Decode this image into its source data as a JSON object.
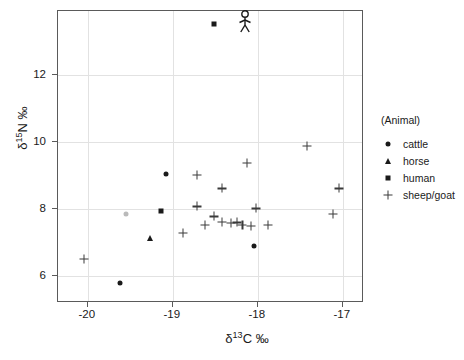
{
  "chart_data": {
    "type": "scatter",
    "title": "",
    "xlabel": "δ 13C ‰",
    "ylabel": "δ 15N ‰",
    "xlim": [
      -20.35,
      -16.75
    ],
    "ylim": [
      5.2,
      13.9
    ],
    "xticks": [
      -20,
      -19,
      -18,
      -17
    ],
    "yticks": [
      6,
      8,
      10,
      12
    ],
    "xticklabels": [
      "-20",
      "-19",
      "-18",
      "-17"
    ],
    "yticklabels": [
      "6",
      "8",
      "10",
      "12"
    ],
    "grid": true,
    "grid_color": "#e2e2e2",
    "legend_position": "right-outside",
    "legend_title": "(Animal)",
    "annotation_icon": "human-stick-figure",
    "annotation_x": -18.35,
    "annotation_y": 13.5,
    "series": [
      {
        "name": "cattle",
        "marker": "circle",
        "color": "#1a1a1a",
        "points": [
          {
            "x": -19.62,
            "y": 5.8
          },
          {
            "x": -19.08,
            "y": 9.05
          },
          {
            "x": -19.55,
            "y": 7.85,
            "faint": true
          },
          {
            "x": -18.05,
            "y": 6.9
          }
        ]
      },
      {
        "name": "horse",
        "marker": "triangle",
        "color": "#1a1a1a",
        "points": [
          {
            "x": -19.27,
            "y": 7.15
          }
        ]
      },
      {
        "name": "human",
        "marker": "square",
        "color": "#1a1a1a",
        "points": [
          {
            "x": -18.52,
            "y": 13.5
          },
          {
            "x": -19.14,
            "y": 7.95
          }
        ]
      },
      {
        "name": "sheep/goat",
        "marker": "plus",
        "color": "#3a3a3a",
        "points": [
          {
            "x": -20.05,
            "y": 6.52
          },
          {
            "x": -18.72,
            "y": 9.02
          },
          {
            "x": -18.42,
            "y": 8.62
          },
          {
            "x": -18.13,
            "y": 9.38
          },
          {
            "x": -17.42,
            "y": 9.88
          },
          {
            "x": -18.72,
            "y": 8.08
          },
          {
            "x": -18.52,
            "y": 7.78
          },
          {
            "x": -18.42,
            "y": 7.62
          },
          {
            "x": -18.32,
            "y": 7.58
          },
          {
            "x": -18.25,
            "y": 7.6
          },
          {
            "x": -18.18,
            "y": 7.52
          },
          {
            "x": -18.08,
            "y": 7.5
          },
          {
            "x": -18.02,
            "y": 8.02
          },
          {
            "x": -17.88,
            "y": 7.52
          },
          {
            "x": -17.05,
            "y": 8.62
          },
          {
            "x": -17.12,
            "y": 7.85
          },
          {
            "x": -18.88,
            "y": 7.28
          },
          {
            "x": -18.62,
            "y": 7.52
          }
        ]
      }
    ]
  },
  "legend": {
    "title": "(Animal)",
    "items": [
      {
        "label": "cattle",
        "marker": "circle"
      },
      {
        "label": "horse",
        "marker": "triangle"
      },
      {
        "label": "human",
        "marker": "square"
      },
      {
        "label": "sheep/goat",
        "marker": "plus"
      }
    ]
  },
  "axes": {
    "x_title_main": "δ",
    "x_title_sup": "13",
    "x_title_rest": "C ‰",
    "y_title_main": "δ",
    "y_title_sup": "15",
    "y_title_rest": "N ‰"
  },
  "caption": {
    "text": ""
  }
}
